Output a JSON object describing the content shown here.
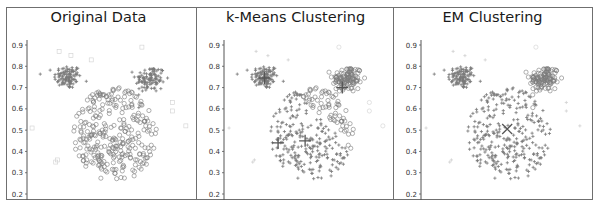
{
  "figure": {
    "panels": [
      "Original Data",
      "k-Means Clustering",
      "EM Clustering"
    ]
  },
  "chart_data": [
    {
      "type": "scatter",
      "title": "Original Data",
      "xlabel": "",
      "ylabel": "",
      "ylim": [
        0.17,
        0.93
      ],
      "yticks": [
        0.2,
        0.3,
        0.4,
        0.5,
        0.6,
        0.7,
        0.8,
        0.9
      ],
      "xticks": [],
      "grid": false,
      "legend": null,
      "series": [
        {
          "name": "left ear cluster",
          "marker": "plus",
          "center": [
            0.24,
            0.75
          ],
          "spread": [
            0.05,
            0.035
          ],
          "count": 110
        },
        {
          "name": "right ear cluster",
          "marker": "plus",
          "center": [
            0.73,
            0.74
          ],
          "spread": [
            0.055,
            0.04
          ],
          "count": 110
        },
        {
          "name": "head cluster",
          "marker": "circle",
          "center": [
            0.52,
            0.48
          ],
          "spread": [
            0.16,
            0.11
          ],
          "count": 300
        },
        {
          "name": "noise",
          "marker": "square",
          "points": [
            [
              0.03,
              0.51
            ],
            [
              0.18,
              0.36
            ],
            [
              0.19,
              0.87
            ],
            [
              0.26,
              0.85
            ],
            [
              0.38,
              0.83
            ],
            [
              0.68,
              0.89
            ],
            [
              0.86,
              0.63
            ],
            [
              0.86,
              0.59
            ],
            [
              0.94,
              0.52
            ],
            [
              0.17,
              0.35
            ]
          ]
        }
      ]
    },
    {
      "type": "scatter",
      "title": "k-Means Clustering",
      "xlabel": "",
      "ylabel": "",
      "ylim": [
        0.17,
        0.93
      ],
      "yticks": [
        0.2,
        0.3,
        0.4,
        0.5,
        0.6,
        0.7,
        0.8,
        0.9
      ],
      "xticks": [],
      "grid": false,
      "legend": null,
      "series": [
        {
          "name": "cluster A (left ear)",
          "marker": "plus",
          "center": [
            0.24,
            0.75
          ],
          "count": 110
        },
        {
          "name": "cluster B (right ear + right head)",
          "marker": "circle",
          "center": [
            0.72,
            0.72
          ],
          "count": 190
        },
        {
          "name": "cluster C (head)",
          "marker": "plus",
          "center": [
            0.45,
            0.45
          ],
          "count": 240
        }
      ],
      "centroids": [
        [
          0.24,
          0.745
        ],
        [
          0.7,
          0.7
        ],
        [
          0.48,
          0.45
        ],
        [
          0.32,
          0.44
        ]
      ]
    },
    {
      "type": "scatter",
      "title": "EM Clustering",
      "xlabel": "",
      "ylabel": "",
      "ylim": [
        0.17,
        0.93
      ],
      "yticks": [
        0.2,
        0.3,
        0.4,
        0.5,
        0.6,
        0.7,
        0.8,
        0.9
      ],
      "xticks": [],
      "grid": false,
      "legend": null,
      "series": [
        {
          "name": "cluster A (left ear)",
          "marker": "plus",
          "center": [
            0.24,
            0.75
          ],
          "count": 110
        },
        {
          "name": "cluster B (right ear)",
          "marker": "circle",
          "center": [
            0.73,
            0.74
          ],
          "count": 110
        },
        {
          "name": "cluster C (head)",
          "marker": "plus",
          "center": [
            0.52,
            0.48
          ],
          "count": 300
        }
      ],
      "centroids": [
        [
          0.24,
          0.75
        ],
        [
          0.73,
          0.74
        ],
        [
          0.51,
          0.505
        ]
      ]
    }
  ],
  "style": {
    "point_color": "#7a7a7a",
    "noise_color": "#d0d0d0",
    "axis_color": "#555555",
    "frame_color": "#6f6f6f"
  }
}
